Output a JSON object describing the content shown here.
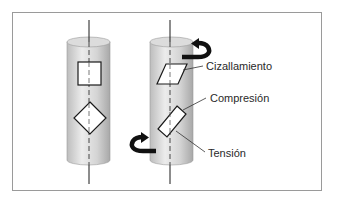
{
  "diagram": {
    "type": "stress-states-on-cylinder-under-torsion",
    "colors": {
      "frame": "#9a9a9a",
      "cylinder_light": "#e6e6e6",
      "cylinder_dark": "#b5b5b5",
      "cylinder_top": "#d9d9d9",
      "stroke": "#1a1a1a",
      "arrow": "#111111"
    },
    "left_cylinder": {
      "state": "unloaded",
      "elements": [
        "square-element",
        "diamond-element"
      ]
    },
    "right_cylinder": {
      "state": "twisted",
      "elements": [
        "sheared-parallelogram",
        "rotated-rectangle"
      ],
      "torque_arrows": [
        "top-torque-arrow",
        "bottom-torque-arrow"
      ]
    },
    "labels": {
      "shear": "Cizallamiento",
      "compression": "Compresión",
      "tension": "Tensión"
    }
  }
}
